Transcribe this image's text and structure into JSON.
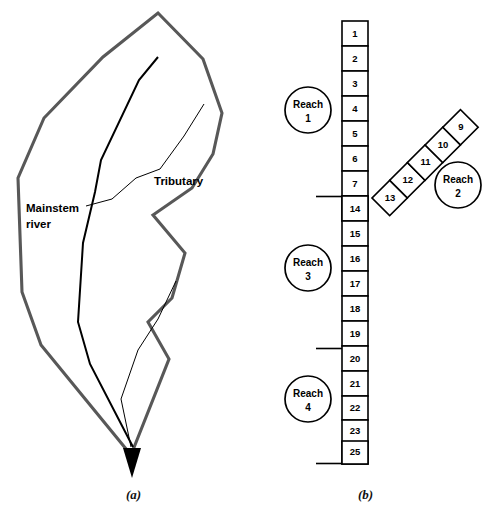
{
  "figure": {
    "captions": {
      "panel_a": "(a)",
      "panel_b": "(b)"
    }
  },
  "panel_a": {
    "name": "watershed-map",
    "labels": {
      "mainstem_line1": "Mainstem",
      "mainstem_line2": "river",
      "tributary": "Tributary"
    },
    "colors": {
      "watershed_boundary": "#585858",
      "stream": "#000000"
    }
  },
  "panel_b": {
    "name": "reach-cell-network",
    "colors": {
      "cell_stroke": "#000000",
      "cell_fill": "#ffffff"
    },
    "mainstem_cells_upper": [
      "1",
      "2",
      "3",
      "4",
      "5",
      "6",
      "7",
      "8"
    ],
    "tributary_cells": [
      "13",
      "12",
      "11",
      "10",
      "9"
    ],
    "mainstem_cells_lower": [
      "14",
      "15",
      "16",
      "17",
      "18",
      "19",
      "20",
      "21",
      "22",
      "23",
      "24",
      "25"
    ],
    "reaches": [
      {
        "id": "reach-1",
        "title": "Reach",
        "number": "1",
        "cells": [
          "1",
          "2",
          "3",
          "4",
          "5",
          "6",
          "7",
          "8"
        ]
      },
      {
        "id": "reach-2",
        "title": "Reach",
        "number": "2",
        "cells": [
          "9",
          "10",
          "11",
          "12",
          "13"
        ]
      },
      {
        "id": "reach-3",
        "title": "Reach",
        "number": "3",
        "cells": [
          "14",
          "15",
          "16",
          "17",
          "18",
          "19",
          "20"
        ]
      },
      {
        "id": "reach-4",
        "title": "Reach",
        "number": "4",
        "cells": [
          "21",
          "22",
          "23",
          "24",
          "25"
        ]
      }
    ]
  }
}
